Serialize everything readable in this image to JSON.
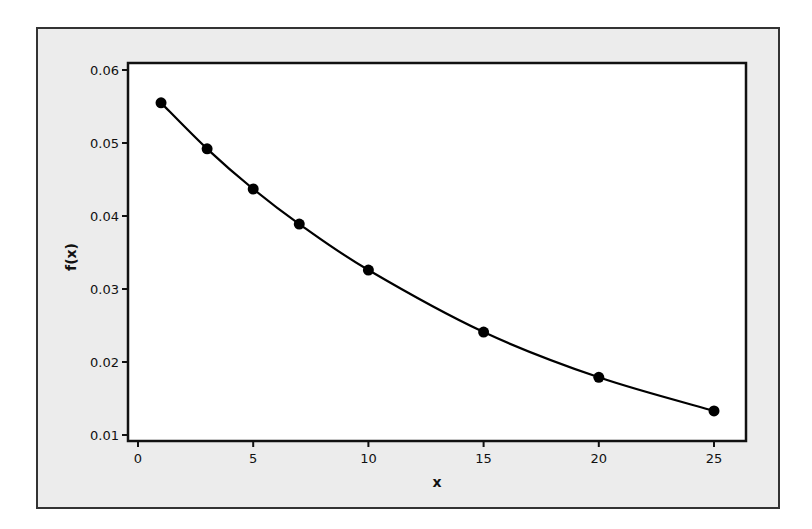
{
  "chart_data": {
    "type": "line",
    "title": "",
    "xlabel": "x",
    "ylabel": "f(x)",
    "x": [
      1,
      3,
      5,
      7,
      10,
      15,
      20,
      25
    ],
    "series": [
      {
        "name": "f(x)",
        "values": [
          0.0555,
          0.0492,
          0.0437,
          0.0389,
          0.0326,
          0.0241,
          0.0179,
          0.0133
        ],
        "markers": true,
        "color": "#000000"
      }
    ],
    "xlim": [
      -0.4,
      26.3
    ],
    "ylim": [
      0.0093,
      0.0611
    ],
    "xticks": [
      0,
      5,
      10,
      15,
      20,
      25
    ],
    "xtick_labels": [
      "0",
      "5",
      "10",
      "15",
      "20",
      "25"
    ],
    "yticks": [
      0.01,
      0.02,
      0.03,
      0.04,
      0.05,
      0.06
    ],
    "ytick_labels": [
      "0.01",
      "0.02",
      "0.03",
      "0.04",
      "0.05",
      "0.06"
    ],
    "grid": false,
    "legend": null
  },
  "colors": {
    "frame_background": "#ececec",
    "plot_background": "#ffffff",
    "line": "#000000"
  }
}
